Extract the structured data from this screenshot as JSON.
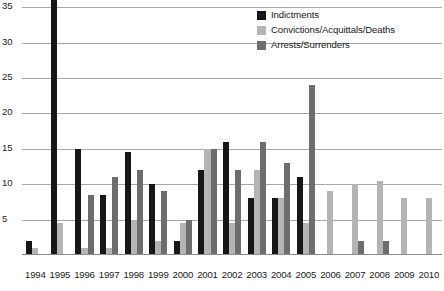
{
  "chart_data": {
    "type": "bar",
    "title": "",
    "xlabel": "",
    "ylabel": "",
    "ylim": [
      0,
      36
    ],
    "grid": true,
    "legend_position": "top-right",
    "yticks": [
      35,
      30,
      25,
      20,
      15,
      10,
      5
    ],
    "categories": [
      "1994",
      "1995",
      "1996",
      "1997",
      "1998",
      "1999",
      "2000",
      "2001",
      "2002",
      "2003",
      "2004",
      "2005",
      "2006",
      "2007",
      "2008",
      "2009",
      "2010"
    ],
    "series": [
      {
        "name": "Indictments",
        "color": "#171717",
        "values": [
          2,
          36,
          15,
          8.5,
          14.5,
          10,
          2,
          12,
          16,
          8,
          8,
          11,
          0,
          0,
          0,
          0,
          0
        ],
        "notes": "1995 bar is clipped at the top of the plot area (value exceeds 35)"
      },
      {
        "name": "Convictions/Acquittals/Deaths",
        "color": "#b4b4b4",
        "values": [
          1,
          4.5,
          1,
          1,
          5,
          2,
          4.5,
          15,
          4.5,
          12,
          8,
          4.5,
          9,
          10,
          10.5,
          8,
          8
        ]
      },
      {
        "name": "Arrests/Surrenders",
        "color": "#6d6d6d",
        "values": [
          0,
          0,
          8.5,
          11,
          12,
          9,
          5,
          15,
          12,
          16,
          13,
          24,
          0,
          2,
          2,
          0,
          0
        ]
      }
    ]
  }
}
